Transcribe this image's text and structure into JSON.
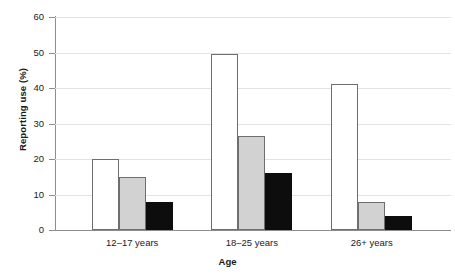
{
  "chart_data": {
    "type": "bar",
    "title": "",
    "xlabel": "Age",
    "ylabel": "Reporting use (%)",
    "categories": [
      "12–17 years",
      "18–25 years",
      "26+ years"
    ],
    "series": [
      {
        "name": "white",
        "color": "#ffffff",
        "values": [
          20,
          49.5,
          41
        ]
      },
      {
        "name": "gray",
        "color": "#d2d2d2",
        "values": [
          15,
          26.5,
          8
        ]
      },
      {
        "name": "black",
        "color": "#0d0d0d",
        "values": [
          8,
          16,
          4
        ]
      }
    ],
    "ylim": [
      0,
      60
    ],
    "yticks": [
      0,
      10,
      20,
      30,
      40,
      50,
      60
    ],
    "ytick_labels": [
      "0",
      "10",
      "20",
      "30",
      "40",
      "50",
      "60"
    ],
    "grid": "horizontal",
    "legend": "none"
  },
  "axes": {
    "y_title": "Reporting use (%)",
    "x_title": "Age",
    "y_ticks": [
      {
        "label": "60",
        "value": 60
      },
      {
        "label": "50",
        "value": 50
      },
      {
        "label": "40",
        "value": 40
      },
      {
        "label": "30",
        "value": 30
      },
      {
        "label": "20",
        "value": 20
      },
      {
        "label": "10",
        "value": 10
      },
      {
        "label": "0",
        "value": 0
      }
    ]
  },
  "groups": [
    {
      "label": "12–17 years",
      "bars": [
        {
          "style": "white",
          "value": 20
        },
        {
          "style": "gray",
          "value": 15
        },
        {
          "style": "black",
          "value": 8
        }
      ]
    },
    {
      "label": "18–25 years",
      "bars": [
        {
          "style": "white",
          "value": 49.5
        },
        {
          "style": "gray",
          "value": 26.5
        },
        {
          "style": "black",
          "value": 16
        }
      ]
    },
    {
      "label": "26+ years",
      "bars": [
        {
          "style": "white",
          "value": 41
        },
        {
          "style": "gray",
          "value": 8
        },
        {
          "style": "black",
          "value": 4
        }
      ]
    }
  ]
}
